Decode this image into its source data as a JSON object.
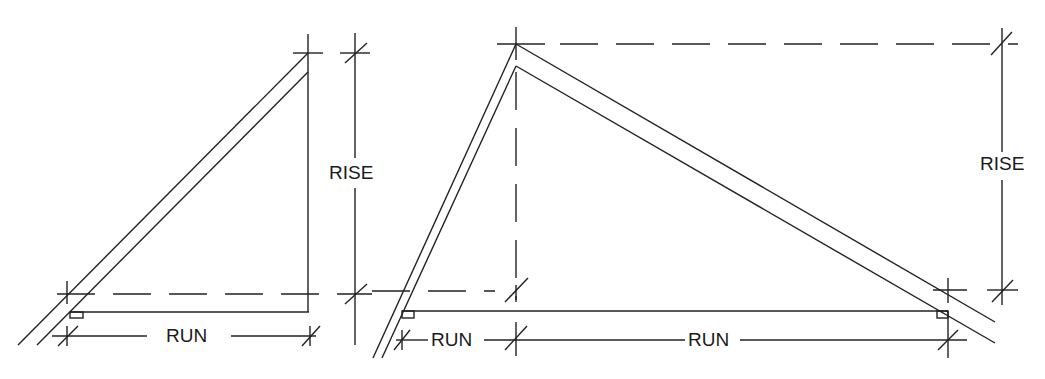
{
  "figure": {
    "left": {
      "rise_label": "RISE",
      "run_label": "RUN"
    },
    "right": {
      "rise_label": "RISE",
      "run_left_label": "RUN",
      "run_right_label": "RUN"
    }
  },
  "colors": {
    "line": "#222222",
    "background": "#ffffff"
  }
}
